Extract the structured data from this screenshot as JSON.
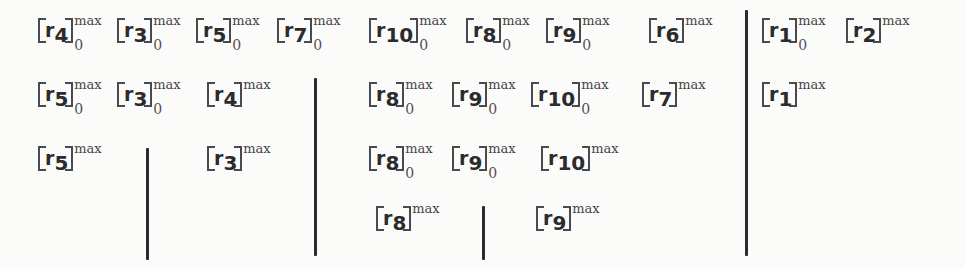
{
  "figure": {
    "type": "math-expression-diagram",
    "symbol": "r",
    "superscript": "max",
    "subscript": "0",
    "ink_color": "#2b2b2f",
    "background_color": "#fbfbf9"
  },
  "terms": [
    {
      "id": "t1",
      "row": 1,
      "index": "4",
      "sup": "max",
      "sub": "0",
      "x": 38,
      "y": 18
    },
    {
      "id": "t2",
      "row": 1,
      "index": "3",
      "sup": "max",
      "sub": "0",
      "x": 117,
      "y": 18
    },
    {
      "id": "t3",
      "row": 1,
      "index": "5",
      "sup": "max",
      "sub": "0",
      "x": 196,
      "y": 18
    },
    {
      "id": "t4",
      "row": 1,
      "index": "7",
      "sup": "max",
      "sub": "0",
      "x": 277,
      "y": 18
    },
    {
      "id": "t5",
      "row": 1,
      "index": "10",
      "sup": "max",
      "sub": "0",
      "x": 369,
      "y": 18
    },
    {
      "id": "t6",
      "row": 1,
      "index": "8",
      "sup": "max",
      "sub": "0",
      "x": 466,
      "y": 18
    },
    {
      "id": "t7",
      "row": 1,
      "index": "9",
      "sup": "max",
      "sub": "0",
      "x": 546,
      "y": 18
    },
    {
      "id": "t8",
      "row": 1,
      "index": "6",
      "sup": "max",
      "sub": "",
      "x": 649,
      "y": 18
    },
    {
      "id": "t9",
      "row": 1,
      "index": "1",
      "sup": "max",
      "sub": "0",
      "x": 762,
      "y": 18
    },
    {
      "id": "t10",
      "row": 1,
      "index": "2",
      "sup": "max",
      "sub": "",
      "x": 846,
      "y": 18
    },
    {
      "id": "t11",
      "row": 2,
      "index": "5",
      "sup": "max",
      "sub": "0",
      "x": 38,
      "y": 82
    },
    {
      "id": "t12",
      "row": 2,
      "index": "3",
      "sup": "max",
      "sub": "0",
      "x": 117,
      "y": 82
    },
    {
      "id": "t13",
      "row": 2,
      "index": "4",
      "sup": "max",
      "sub": "",
      "x": 207,
      "y": 82
    },
    {
      "id": "t14",
      "row": 2,
      "index": "8",
      "sup": "max",
      "sub": "0",
      "x": 369,
      "y": 82
    },
    {
      "id": "t15",
      "row": 2,
      "index": "9",
      "sup": "max",
      "sub": "0",
      "x": 452,
      "y": 82
    },
    {
      "id": "t16",
      "row": 2,
      "index": "10",
      "sup": "max",
      "sub": "0",
      "x": 531,
      "y": 82
    },
    {
      "id": "t17",
      "row": 2,
      "index": "7",
      "sup": "max",
      "sub": "",
      "x": 642,
      "y": 82
    },
    {
      "id": "t18",
      "row": 2,
      "index": "1",
      "sup": "max",
      "sub": "",
      "x": 762,
      "y": 82
    },
    {
      "id": "t19",
      "row": 3,
      "index": "5",
      "sup": "max",
      "sub": "",
      "x": 38,
      "y": 146
    },
    {
      "id": "t20",
      "row": 3,
      "index": "3",
      "sup": "max",
      "sub": "",
      "x": 207,
      "y": 146
    },
    {
      "id": "t21",
      "row": 3,
      "index": "8",
      "sup": "max",
      "sub": "0",
      "x": 369,
      "y": 146
    },
    {
      "id": "t22",
      "row": 3,
      "index": "9",
      "sup": "max",
      "sub": "0",
      "x": 452,
      "y": 146
    },
    {
      "id": "t23",
      "row": 3,
      "index": "10",
      "sup": "max",
      "sub": "",
      "x": 541,
      "y": 146
    },
    {
      "id": "t24",
      "row": 4,
      "index": "8",
      "sup": "max",
      "sub": "",
      "x": 376,
      "y": 206
    },
    {
      "id": "t25",
      "row": 4,
      "index": "9",
      "sup": "max",
      "sub": "",
      "x": 536,
      "y": 206
    }
  ],
  "dividers": [
    {
      "id": "d1",
      "x": 146,
      "y": 148,
      "height": 112
    },
    {
      "id": "d2",
      "x": 314,
      "y": 78,
      "height": 178
    },
    {
      "id": "d3",
      "x": 482,
      "y": 206,
      "height": 54
    },
    {
      "id": "d4",
      "x": 745,
      "y": 10,
      "height": 246
    }
  ]
}
